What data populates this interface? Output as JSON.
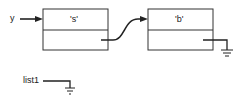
{
  "diagram": {
    "pointer_label": "y",
    "list_label": "list1",
    "nodes": [
      {
        "id": "node-1",
        "value": "'s'",
        "next": "node-2"
      },
      {
        "id": "node-2",
        "value": "'b'",
        "next": "null"
      }
    ],
    "colors": {
      "stroke": "#222222",
      "background": "#ffffff"
    }
  }
}
